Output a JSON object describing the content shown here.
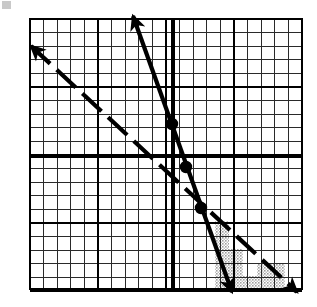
{
  "figure": {
    "corner_mark": "",
    "background_color": "#ffffff",
    "ink_color": "#000000",
    "shade_color": "#b8b8b8"
  },
  "grid": {
    "left": 30,
    "top": 19,
    "right": 302,
    "bottom": 289,
    "cell_px": 13.6,
    "minor_color": "#2a2a2a",
    "minor_width": 1.1,
    "major_color": "#000000",
    "major_width": 2.4,
    "major_every": 5,
    "cols": 20,
    "rows": 20,
    "show_grid": true
  },
  "axes": {
    "x_axis_y": 156,
    "y_axis_x": 173,
    "axis_color": "#000000",
    "axis_width": 3.4,
    "labels_shown": false,
    "tick_labels_shown": false
  },
  "lines": [
    {
      "name": "steep-solid-line",
      "style": "solid",
      "stroke": "#000000",
      "width": 4.2,
      "x1": 133,
      "y1": 16,
      "x2": 232,
      "y2": 292,
      "arrow_start": true,
      "arrow_end": true,
      "description": "steep negative-slope solid boundary line"
    },
    {
      "name": "shallow-dashed-line",
      "style": "dashed",
      "stroke": "#000000",
      "width": 4.2,
      "dash": "26 9",
      "x1": 31,
      "y1": 46,
      "x2": 297,
      "y2": 292,
      "arrow_start": true,
      "arrow_end": true,
      "description": "shallow negative-slope dashed boundary line"
    }
  ],
  "points": [
    {
      "name": "point-upper",
      "x": 172,
      "y": 124,
      "r": 5.4,
      "filled": true
    },
    {
      "name": "point-middle",
      "x": 186,
      "y": 167,
      "r": 5.4,
      "filled": true
    },
    {
      "name": "point-intersection",
      "x": 201,
      "y": 208,
      "r": 5.4,
      "filled": true
    }
  ],
  "shaded_region": {
    "name": "solution-region",
    "fill": "#b8b8b8",
    "opacity": 0.62,
    "pattern": "stipple",
    "steps": [
      {
        "x": 215,
        "y": 221,
        "w": 14,
        "h": 14
      },
      {
        "x": 215,
        "y": 235,
        "w": 14,
        "h": 14
      },
      {
        "x": 215,
        "y": 249,
        "w": 28,
        "h": 14
      },
      {
        "x": 215,
        "y": 263,
        "w": 28,
        "h": 13
      },
      {
        "x": 215,
        "y": 276,
        "w": 42,
        "h": 13
      },
      {
        "x": 257,
        "y": 263,
        "w": 28,
        "h": 13
      },
      {
        "x": 257,
        "y": 276,
        "w": 28,
        "h": 13
      }
    ],
    "description": "stippled wedge between the two boundary lines in the lower right quadrant"
  },
  "chart_data": {
    "type": "line",
    "xlabel": "",
    "ylabel": "",
    "grid": true,
    "legend": "none",
    "xlim": [
      -10,
      10
    ],
    "ylim": [
      -10,
      10
    ],
    "categories": [],
    "series": [
      {
        "name": "Solid boundary line",
        "style": "solid",
        "slope": -2.8,
        "y_intercept": 2.3,
        "points": [
          [
            -3.0,
            10.3
          ],
          [
            0.0,
            2.3
          ],
          [
            4.3,
            -9.8
          ]
        ],
        "endpoints_have_arrows": true
      },
      {
        "name": "Dashed boundary line",
        "style": "dashed",
        "slope": -0.92,
        "y_intercept": -1.0,
        "points": [
          [
            -10.4,
            8.1
          ],
          [
            0.0,
            -1.0
          ],
          [
            9.1,
            -10.0
          ]
        ],
        "endpoints_have_arrows": true
      }
    ],
    "marked_points": [
      [
        -0.1,
        2.3
      ],
      [
        0.9,
        -0.8
      ],
      [
        2.1,
        -3.8
      ]
    ],
    "shaded_region": {
      "label": "solution set",
      "between": [
        "Solid boundary line",
        "Dashed boundary line"
      ],
      "quadrant": "lower-right",
      "fill": "#b8b8b8"
    }
  }
}
